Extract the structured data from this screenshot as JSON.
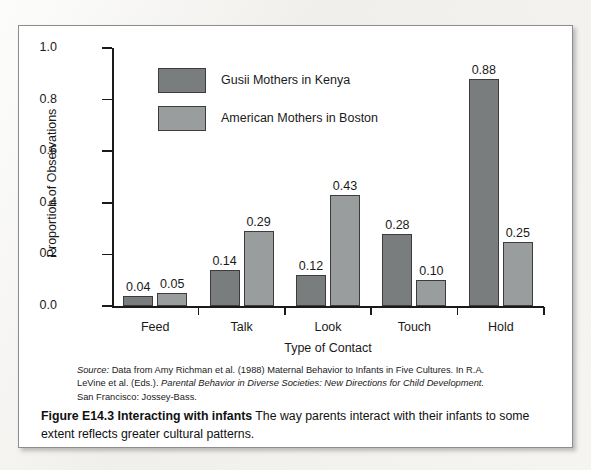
{
  "chart_data": {
    "type": "bar",
    "title": "",
    "categories": [
      "Feed",
      "Talk",
      "Look",
      "Touch",
      "Hold"
    ],
    "series": [
      {
        "name": "Gusii Mothers in Kenya",
        "color": "#7a7d7d",
        "values": [
          0.04,
          0.14,
          0.12,
          0.28,
          0.88
        ]
      },
      {
        "name": "American Mothers in Boston",
        "color": "#9a9d9d",
        "values": [
          0.05,
          0.29,
          0.43,
          0.1,
          0.25
        ]
      }
    ],
    "value_labels": [
      [
        "0.04",
        "0.14",
        "0.12",
        "0.28",
        "0.88"
      ],
      [
        "0.05",
        "0.29",
        "0.43",
        "0.10",
        "0.25"
      ]
    ],
    "xlabel": "Type of Contact",
    "ylabel": "Proportion of Observations",
    "ylim": [
      0.0,
      1.0
    ],
    "ytick_labels": [
      "0.0",
      "0.2",
      "0.4",
      "0.6",
      "0.8",
      "1.0"
    ],
    "ytick_values": [
      0.0,
      0.2,
      0.4,
      0.6,
      0.8,
      1.0
    ],
    "grid": false,
    "legend_position": "upper-left-inside"
  },
  "legend": {
    "items": [
      {
        "label": "Gusii Mothers in Kenya"
      },
      {
        "label": "American Mothers in Boston"
      }
    ]
  },
  "source": {
    "label": "Source:",
    "line1_rest": " Data from Amy Richman et al. (1988) Maternal Behavior to Infants in Five Cultures. In R.A.",
    "line2_plain": "LeVine et al. (Eds.). ",
    "line2_italic": "Parental Behavior in Diverse Societies: New Directions for Child Development.",
    "line3": "San Francisco: Jossey-Bass."
  },
  "caption": {
    "figure_label": "Figure E14.3 Interacting with infants",
    "body": " The way parents interact with their infants to some extent reflects greater cultural patterns."
  }
}
